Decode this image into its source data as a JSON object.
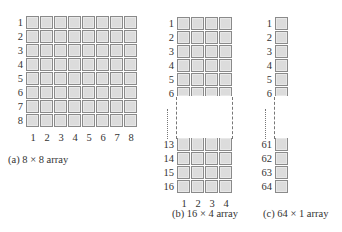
{
  "diagram": {
    "figures": [
      {
        "id": "a",
        "caption": "(a)  8 × 8 array",
        "rows": 8,
        "cols": 8,
        "row_labels": [
          "1",
          "2",
          "3",
          "4",
          "5",
          "6",
          "7",
          "8"
        ],
        "col_labels": [
          "1",
          "2",
          "3",
          "4",
          "5",
          "6",
          "7",
          "8"
        ]
      },
      {
        "id": "b",
        "caption": "(b)  16 × 4 array",
        "rows": 16,
        "cols": 4,
        "row_labels_top": [
          "1",
          "2",
          "3",
          "4",
          "5",
          "6"
        ],
        "row_labels_bottom": [
          "13",
          "14",
          "15",
          "16"
        ],
        "col_labels": [
          "1",
          "2",
          "3",
          "4"
        ],
        "truncated": true
      },
      {
        "id": "c",
        "caption": "(c)  64 × 1 array",
        "rows": 64,
        "cols": 1,
        "row_labels_top": [
          "1",
          "2",
          "3",
          "4",
          "5",
          "6"
        ],
        "row_labels_bottom": [
          "61",
          "62",
          "63",
          "64"
        ],
        "truncated": true
      }
    ],
    "colors": {
      "cell_fill": "#dcdcdc",
      "cell_border": "#8a8a8a",
      "text": "#333333"
    }
  }
}
